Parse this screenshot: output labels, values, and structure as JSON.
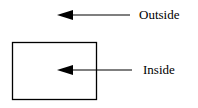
{
  "diagram": {
    "outside_label": "Outside",
    "inside_label": "Inside",
    "stroke_color": "#000000",
    "box": {
      "x": 12,
      "y": 42,
      "width": 85,
      "height": 58
    },
    "arrows": [
      {
        "name": "outside-arrow",
        "tip_x": 57,
        "y": 15,
        "tail_x": 130
      },
      {
        "name": "inside-arrow",
        "tip_x": 57,
        "y": 70,
        "tail_x": 132
      }
    ]
  }
}
